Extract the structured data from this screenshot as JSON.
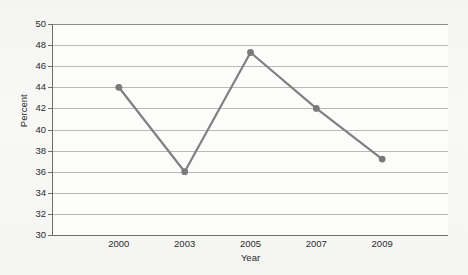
{
  "chart_data": {
    "type": "line",
    "title": "",
    "xlabel": "Year",
    "ylabel": "Percent",
    "categories": [
      "2000",
      "2003",
      "2005",
      "2007",
      "2009"
    ],
    "values": [
      44,
      36,
      47.3,
      42,
      37.2
    ],
    "series": [
      {
        "name": "Percent",
        "values": [
          44,
          36,
          47.3,
          42,
          37.2
        ]
      }
    ],
    "ylim": [
      30,
      50
    ],
    "yticks": [
      50,
      48,
      46,
      44,
      42,
      40,
      38,
      36,
      34,
      32,
      30
    ],
    "ytick_labels": [
      "50",
      "48",
      "46",
      "44",
      "42",
      "40",
      "38",
      "36",
      "34",
      "32",
      "30"
    ],
    "grid": "horizontal",
    "legend": "none",
    "marker": "circle",
    "line_color": "#808080",
    "marker_color": "#7a7a7a",
    "gridline_color": "#b9b9b7",
    "plot_background": "#fcfcfb",
    "figure_background": "#f5f5f4",
    "axis_color": "#6e6e6c",
    "text_color": "#2b2b2b"
  }
}
